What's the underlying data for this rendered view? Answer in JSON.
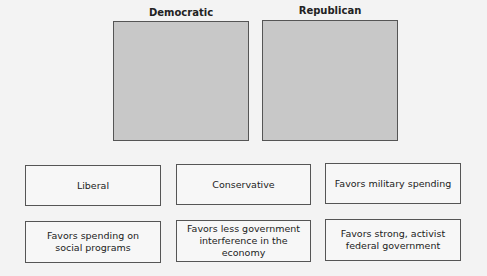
{
  "columns": [
    {
      "title": "Democratic"
    },
    {
      "title": "Republican"
    }
  ],
  "cards": [
    {
      "label": "Liberal"
    },
    {
      "label": "Conservative"
    },
    {
      "label": "Favors military spending"
    },
    {
      "label": "Favors spending on\nsocial programs"
    },
    {
      "label": "Favors less government\ninterference in the economy"
    },
    {
      "label": "Favors strong, activist\nfederal government"
    }
  ]
}
